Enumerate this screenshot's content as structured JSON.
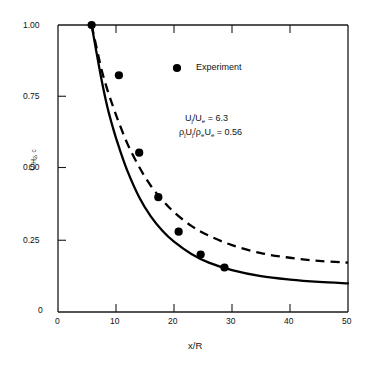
{
  "chart_data": {
    "type": "scatter",
    "title": "",
    "xlabel": "x/R",
    "ylabel": "C_H2,c",
    "xlim": [
      0,
      50
    ],
    "ylim": [
      0,
      1.0
    ],
    "grid": false,
    "xticks": [
      "0",
      "10",
      "20",
      "30",
      "40",
      "50"
    ],
    "xtick_values": [
      0,
      10,
      20,
      30,
      40,
      50
    ],
    "yticks": [
      "0",
      "0.25",
      "0.50",
      "0.75",
      "1.00"
    ],
    "ytick_values": [
      0,
      0.25,
      0.5,
      0.75,
      1.0
    ],
    "legend": [
      {
        "label": "Experiment",
        "marker": "filled-circle"
      }
    ],
    "legend_position": "upper-center",
    "annotations": [
      "U_j/U_e = 6.3",
      "rho_j U_j / rho_e U_e = 0.56"
    ],
    "series": [
      {
        "name": "Experiment",
        "type": "scatter",
        "marker": "filled-circle",
        "x": [
          5.8,
          10.5,
          14.0,
          17.3,
          20.8,
          24.6,
          28.7
        ],
        "y": [
          1.0,
          0.825,
          0.555,
          0.4,
          0.28,
          0.2,
          0.155
        ]
      },
      {
        "name": "solid-curve",
        "type": "line",
        "style": "solid",
        "x": [
          5.8,
          6.5,
          7.5,
          8.5,
          9.5,
          10.5,
          12,
          14,
          16,
          18,
          20,
          23,
          26,
          30,
          35,
          40,
          45,
          50
        ],
        "y": [
          1.0,
          0.92,
          0.81,
          0.715,
          0.64,
          0.575,
          0.49,
          0.4,
          0.333,
          0.283,
          0.245,
          0.202,
          0.172,
          0.146,
          0.125,
          0.113,
          0.105,
          0.1
        ]
      },
      {
        "name": "dashed-curve",
        "type": "line",
        "style": "dashed",
        "x": [
          5.8,
          6.5,
          7.5,
          8.5,
          9.5,
          10.5,
          12,
          14,
          16,
          18,
          20,
          23,
          26,
          30,
          35,
          40,
          45,
          50
        ],
        "y": [
          1.0,
          0.935,
          0.845,
          0.775,
          0.715,
          0.66,
          0.585,
          0.505,
          0.44,
          0.39,
          0.348,
          0.3,
          0.266,
          0.233,
          0.205,
          0.189,
          0.178,
          0.172
        ]
      }
    ]
  },
  "axes": {
    "x_title": "x/R",
    "y_title_main": "C",
    "y_title_sub": "H",
    "y_title_sub2": "2",
    "y_title_sub3": ", c",
    "y_title_full": "CH2, c"
  },
  "labels": {
    "x0": "0",
    "x10": "10",
    "x20": "20",
    "x30": "30",
    "x40": "40",
    "x50": "50",
    "y0": "0",
    "y025": "0.25",
    "y050": "0.50",
    "y075": "0.75",
    "y100": "1.00"
  },
  "legend": {
    "experiment_label": "Experiment"
  },
  "annotations": {
    "line1_u": "U",
    "line1_sub_j": "j",
    "line1_slash": "/U",
    "line1_sub_e": "e",
    "line1_eq": " = 6.3",
    "line2_rho": "ρ",
    "line2_eq": " = 0.56"
  },
  "colors": {
    "axis": "#1a1a1a",
    "curve": "#000000",
    "marker": "#000000",
    "background": "#ffffff"
  }
}
